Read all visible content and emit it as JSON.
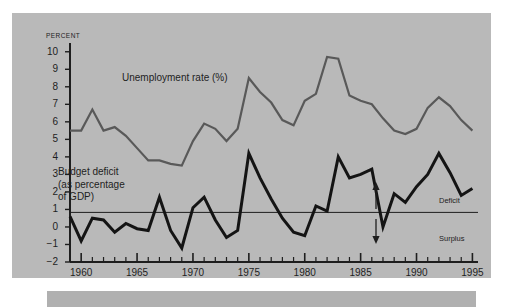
{
  "figure": {
    "background_color": "#b9b9b9",
    "page_background": "#ffffff"
  },
  "chart_data": {
    "type": "line",
    "title": "",
    "subtitle": "",
    "xlabel": "",
    "ylabel": "PERCENT",
    "grid": false,
    "legend_position": "inline-labels",
    "xlim": [
      1959,
      1995.5
    ],
    "ylim": [
      -2,
      10.5
    ],
    "yticks": [
      10,
      9,
      8,
      7,
      6,
      5,
      4,
      3,
      2,
      1,
      0,
      -1,
      -2
    ],
    "ytick_labels": [
      "10",
      "9",
      "8",
      "7",
      "6",
      "5",
      "4",
      "3",
      "2",
      "1",
      "0",
      "−1",
      "−2"
    ],
    "xticks_major": [
      1960,
      1965,
      1970,
      1975,
      1980,
      1985,
      1990,
      1995
    ],
    "xtick_labels": [
      "1960",
      "1965",
      "1970",
      "1975",
      "1980",
      "1985",
      "1990",
      "1995"
    ],
    "xticks_minor_step": 1,
    "zero_line": 0,
    "x": [
      1959,
      1960,
      1961,
      1962,
      1963,
      1964,
      1965,
      1966,
      1967,
      1968,
      1969,
      1970,
      1971,
      1972,
      1973,
      1974,
      1975,
      1976,
      1977,
      1978,
      1979,
      1980,
      1981,
      1982,
      1983,
      1984,
      1985,
      1986,
      1987,
      1988,
      1989,
      1990,
      1991,
      1992,
      1993,
      1994,
      1995
    ],
    "series": [
      {
        "name": "Unemployment rate (%)",
        "color": "#595959",
        "line_width": 2.2,
        "values": [
          5.5,
          5.5,
          6.7,
          5.5,
          5.7,
          5.2,
          4.5,
          3.8,
          3.8,
          3.6,
          3.5,
          4.9,
          5.9,
          5.6,
          4.9,
          5.6,
          8.5,
          7.7,
          7.1,
          6.1,
          5.8,
          7.2,
          7.6,
          9.7,
          9.6,
          7.5,
          7.2,
          7.0,
          6.2,
          5.5,
          5.3,
          5.6,
          6.8,
          7.4,
          6.9,
          6.1,
          5.5
        ]
      },
      {
        "name": "Budget deficit (as percentage of GDP)",
        "color": "#141414",
        "line_width": 3.0,
        "values": [
          0.6,
          -0.8,
          0.5,
          0.4,
          -0.3,
          0.2,
          -0.1,
          -0.2,
          1.7,
          -0.2,
          -1.2,
          1.1,
          1.7,
          0.4,
          -0.6,
          -0.2,
          4.2,
          2.8,
          1.6,
          0.5,
          -0.3,
          -0.5,
          1.2,
          0.9,
          4.0,
          2.8,
          3.0,
          3.3,
          0.0,
          1.9,
          1.4,
          2.3,
          3.0,
          4.2,
          3.1,
          1.8,
          2.2
        ]
      }
    ],
    "annotations": [
      {
        "name": "deficit-direction",
        "text": "Deficit",
        "arrow": "up",
        "x": 1990,
        "y_from": 0,
        "y_to": 1.3
      },
      {
        "name": "surplus-direction",
        "text": "Surplus",
        "arrow": "down",
        "x": 1990,
        "y_from": 0,
        "y_to": -1.1
      }
    ]
  },
  "labels": {
    "axis_unit": "PERCENT",
    "unemployment_inline": "Unemployment rate (%)",
    "deficit_inline": "Budget deficit\n(as percentage\nof GDP)",
    "deficit_inline_line1": "Budget deficit",
    "deficit_inline_line2": "(as percentage",
    "deficit_inline_line3": "of GDP)",
    "annot_deficit": "Deficit",
    "annot_surplus": "Surplus"
  }
}
